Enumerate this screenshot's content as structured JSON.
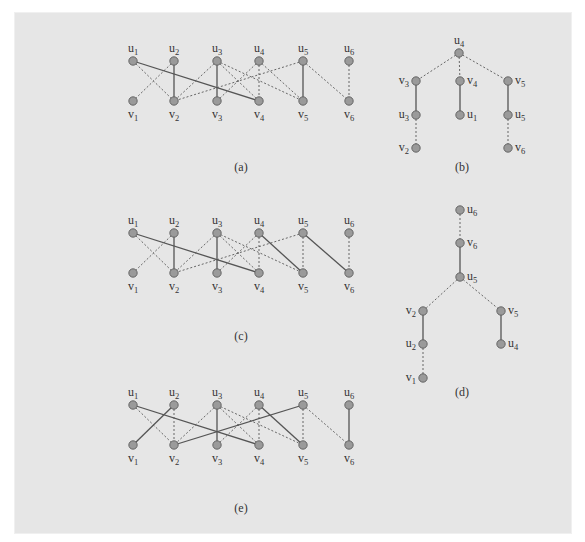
{
  "figure": {
    "background": "#e6e6e6",
    "node_fill": "#9a9a9a",
    "edge_color": "#555555",
    "panels": [
      {
        "id": "a",
        "caption": "(a)",
        "caption_pos": [
          241,
          171
        ],
        "type": "bipartite",
        "top_labels": [
          "u1",
          "u2",
          "u3",
          "u4",
          "u5",
          "u6"
        ],
        "bottom_labels": [
          "v1",
          "v2",
          "v3",
          "v4",
          "v5",
          "v6"
        ],
        "x": [
          133,
          174,
          217,
          259,
          303,
          349
        ],
        "top_y": 61,
        "bottom_y": 101,
        "solid_edges": [
          [
            "u1",
            "v4"
          ],
          [
            "u2",
            "v2"
          ],
          [
            "u3",
            "v3"
          ],
          [
            "u5",
            "v5"
          ]
        ],
        "dotted_edges": [
          [
            "u1",
            "v2"
          ],
          [
            "u2",
            "v1"
          ],
          [
            "u3",
            "v2"
          ],
          [
            "u3",
            "v4"
          ],
          [
            "u3",
            "v5"
          ],
          [
            "u4",
            "v3"
          ],
          [
            "u4",
            "v4"
          ],
          [
            "u4",
            "v5"
          ],
          [
            "u5",
            "v2"
          ],
          [
            "u5",
            "v6"
          ],
          [
            "u6",
            "v6"
          ]
        ]
      },
      {
        "id": "b",
        "caption": "(b)",
        "caption_pos": [
          462,
          171
        ],
        "type": "tree",
        "nodes": [
          {
            "id": "u4",
            "x": 459,
            "y": 53,
            "label": "u4",
            "label_side": "top"
          },
          {
            "id": "v3",
            "x": 416,
            "y": 81,
            "label": "v3",
            "label_side": "left"
          },
          {
            "id": "v4",
            "x": 460,
            "y": 81,
            "label": "v4",
            "label_side": "right"
          },
          {
            "id": "v5",
            "x": 508,
            "y": 81,
            "label": "v5",
            "label_side": "right"
          },
          {
            "id": "u3",
            "x": 416,
            "y": 115,
            "label": "u3",
            "label_side": "left"
          },
          {
            "id": "u1",
            "x": 460,
            "y": 115,
            "label": "u1",
            "label_side": "right"
          },
          {
            "id": "u5",
            "x": 508,
            "y": 115,
            "label": "u5",
            "label_side": "right"
          },
          {
            "id": "v2",
            "x": 416,
            "y": 148,
            "label": "v2",
            "label_side": "left"
          },
          {
            "id": "v6",
            "x": 508,
            "y": 148,
            "label": "v6",
            "label_side": "right"
          }
        ],
        "solid_edges": [
          [
            "v3",
            "u3"
          ],
          [
            "v4",
            "u1"
          ],
          [
            "v5",
            "u5"
          ]
        ],
        "dotted_edges": [
          [
            "u4",
            "v3"
          ],
          [
            "u4",
            "v4"
          ],
          [
            "u4",
            "v5"
          ],
          [
            "u3",
            "v2"
          ],
          [
            "u5",
            "v6"
          ]
        ]
      },
      {
        "id": "c",
        "caption": "(c)",
        "caption_pos": [
          241,
          340
        ],
        "type": "bipartite",
        "top_labels": [
          "u1",
          "u2",
          "u3",
          "u4",
          "u5",
          "u6"
        ],
        "bottom_labels": [
          "v1",
          "v2",
          "v3",
          "v4",
          "v5",
          "v6"
        ],
        "x": [
          133,
          174,
          217,
          259,
          303,
          349
        ],
        "top_y": 233,
        "bottom_y": 273,
        "solid_edges": [
          [
            "u1",
            "v4"
          ],
          [
            "u2",
            "v2"
          ],
          [
            "u3",
            "v3"
          ],
          [
            "u4",
            "v5"
          ],
          [
            "u5",
            "v6"
          ]
        ],
        "dotted_edges": [
          [
            "u1",
            "v2"
          ],
          [
            "u2",
            "v1"
          ],
          [
            "u3",
            "v2"
          ],
          [
            "u3",
            "v4"
          ],
          [
            "u3",
            "v5"
          ],
          [
            "u4",
            "v3"
          ],
          [
            "u4",
            "v4"
          ],
          [
            "u5",
            "v5"
          ],
          [
            "u5",
            "v2"
          ],
          [
            "u6",
            "v6"
          ]
        ]
      },
      {
        "id": "d",
        "caption": "(d)",
        "caption_pos": [
          462,
          396
        ],
        "type": "tree",
        "nodes": [
          {
            "id": "u6",
            "x": 460,
            "y": 210,
            "label": "u6",
            "label_side": "right"
          },
          {
            "id": "v6",
            "x": 460,
            "y": 243,
            "label": "v6",
            "label_side": "right"
          },
          {
            "id": "u5",
            "x": 460,
            "y": 277,
            "label": "u5",
            "label_side": "right"
          },
          {
            "id": "v2",
            "x": 423,
            "y": 311,
            "label": "v2",
            "label_side": "left"
          },
          {
            "id": "v5",
            "x": 501,
            "y": 311,
            "label": "v5",
            "label_side": "right"
          },
          {
            "id": "u2",
            "x": 423,
            "y": 344,
            "label": "u2",
            "label_side": "left"
          },
          {
            "id": "u4",
            "x": 501,
            "y": 344,
            "label": "u4",
            "label_side": "right"
          },
          {
            "id": "v1",
            "x": 423,
            "y": 378,
            "label": "v1",
            "label_side": "left"
          }
        ],
        "solid_edges": [
          [
            "v6",
            "u5"
          ],
          [
            "v2",
            "u2"
          ],
          [
            "v5",
            "u4"
          ]
        ],
        "dotted_edges": [
          [
            "u6",
            "v6"
          ],
          [
            "u5",
            "v2"
          ],
          [
            "u5",
            "v5"
          ],
          [
            "u2",
            "v1"
          ]
        ]
      },
      {
        "id": "e",
        "caption": "(e)",
        "caption_pos": [
          241,
          512
        ],
        "type": "bipartite",
        "top_labels": [
          "u1",
          "u2",
          "u3",
          "u4",
          "u5",
          "u6"
        ],
        "bottom_labels": [
          "v1",
          "v2",
          "v3",
          "v4",
          "v5",
          "v6"
        ],
        "x": [
          133,
          174,
          217,
          259,
          303,
          349
        ],
        "top_y": 405,
        "bottom_y": 445,
        "solid_edges": [
          [
            "u1",
            "v4"
          ],
          [
            "u2",
            "v1"
          ],
          [
            "u3",
            "v3"
          ],
          [
            "u4",
            "v5"
          ],
          [
            "u5",
            "v2"
          ],
          [
            "u6",
            "v6"
          ]
        ],
        "dotted_edges": [
          [
            "u1",
            "v2"
          ],
          [
            "u2",
            "v2"
          ],
          [
            "u3",
            "v2"
          ],
          [
            "u3",
            "v4"
          ],
          [
            "u3",
            "v5"
          ],
          [
            "u4",
            "v3"
          ],
          [
            "u4",
            "v4"
          ],
          [
            "u5",
            "v5"
          ],
          [
            "u5",
            "v6"
          ]
        ]
      }
    ]
  }
}
